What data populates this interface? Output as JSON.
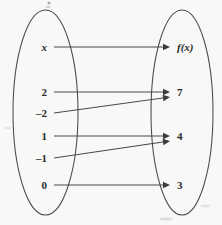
{
  "diagram": {
    "type": "mapping-diagram",
    "background_color": "#f8f8f7",
    "stroke_color": "#4a4a4a",
    "text_color": "#2b2b2b",
    "domain_oval": {
      "name": "domain-set",
      "cx": 45.5,
      "cy": 112.5,
      "rx": 32.5,
      "ry": 102.5
    },
    "range_oval": {
      "name": "range-set",
      "cx": 182,
      "cy": 112.5,
      "rx": 31,
      "ry": 102.5
    },
    "domain_items": [
      {
        "label": "x",
        "x": 47,
        "y": 51,
        "italic": true
      },
      {
        "label": "2",
        "x": 47,
        "y": 96,
        "italic": false
      },
      {
        "label": "–2",
        "x": 47,
        "y": 117,
        "italic": false
      },
      {
        "label": "1",
        "x": 47,
        "y": 140,
        "italic": false
      },
      {
        "label": "–1",
        "x": 47,
        "y": 162,
        "italic": false
      },
      {
        "label": "0",
        "x": 47,
        "y": 189,
        "italic": false
      }
    ],
    "range_items": [
      {
        "label": "f(x)",
        "x": 177,
        "y": 51,
        "italic": true
      },
      {
        "label": "7",
        "x": 177,
        "y": 96,
        "italic": false
      },
      {
        "label": "4",
        "x": 177,
        "y": 140,
        "italic": false
      },
      {
        "label": "3",
        "x": 177,
        "y": 189,
        "italic": false
      }
    ],
    "mappings": [
      {
        "from": "x",
        "to": "f(x)",
        "x1": 54,
        "y1": 47,
        "x2": 170,
        "y2": 47
      },
      {
        "from": "2",
        "to": "7",
        "x1": 54,
        "y1": 92,
        "x2": 170,
        "y2": 92
      },
      {
        "from": "–2",
        "to": "7",
        "x1": 54,
        "y1": 113,
        "x2": 170,
        "y2": 97
      },
      {
        "from": "1",
        "to": "4",
        "x1": 54,
        "y1": 136,
        "x2": 170,
        "y2": 136
      },
      {
        "from": "–1",
        "to": "4",
        "x1": 54,
        "y1": 158,
        "x2": 170,
        "y2": 141
      },
      {
        "from": "0",
        "to": "3",
        "x1": 54,
        "y1": 185,
        "x2": 170,
        "y2": 185
      }
    ],
    "arrow_head_size": {
      "length": 7,
      "half_width": 3.2
    }
  }
}
